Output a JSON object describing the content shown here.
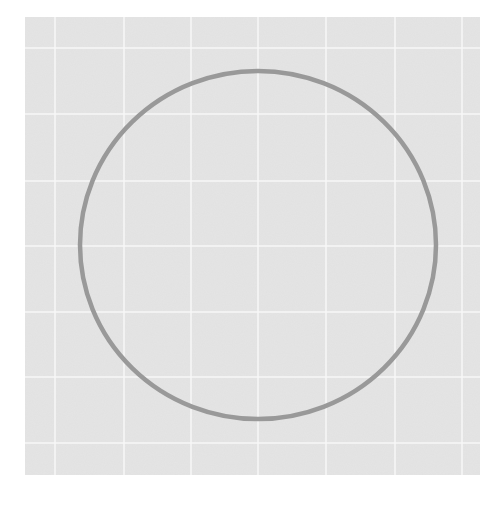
{
  "figure": {
    "background_color": "#ffffff",
    "panel": {
      "x": 25,
      "y": 17,
      "width": 455,
      "height": 458,
      "fill": "#e5e5e5",
      "grid_color": "#f7f7f7",
      "grid_line_width": 1.5,
      "vertical_lines_x": [
        55,
        124,
        191,
        258,
        326,
        395,
        462
      ],
      "horizontal_lines_y": [
        48,
        114,
        181,
        246,
        312,
        377,
        443
      ]
    },
    "shapes": [
      {
        "type": "circle",
        "cx": 258,
        "cy": 245,
        "rx": 178,
        "ry": 174,
        "stroke": "#999999",
        "stroke_width": 4.5,
        "fill": "none"
      }
    ]
  }
}
